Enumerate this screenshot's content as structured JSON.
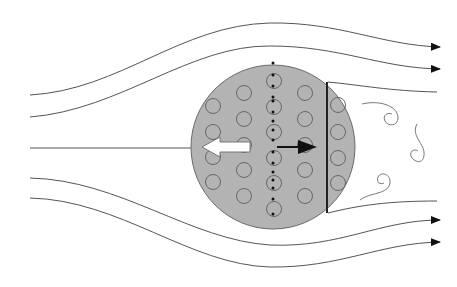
{
  "diagram": {
    "type": "flow-around-body",
    "colors": {
      "background": "#ffffff",
      "body_fill": "#b3b3b3",
      "body_stroke": "#6a6a6a",
      "streamline": "#555555",
      "arrow_dark": "#111111",
      "arrow_light": "#ffffff"
    },
    "body": {
      "cx": 273,
      "cy": 147,
      "r": 82
    },
    "divider_line": {
      "x": 327,
      "y1": 82,
      "y2": 212
    },
    "streamlines_count": 7,
    "inner_circle_columns": [
      {
        "x": 213,
        "ys": [
          106,
          132,
          157,
          182
        ]
      },
      {
        "x": 244,
        "ys": [
          93,
          119,
          145,
          170,
          196
        ]
      },
      {
        "x": 274,
        "ys": [
          81,
          107,
          132,
          158,
          183,
          209
        ]
      },
      {
        "x": 305,
        "ys": [
          93,
          119,
          145,
          170,
          196
        ]
      },
      {
        "x": 338,
        "ys": [
          105,
          132,
          158,
          183
        ]
      }
    ],
    "arrows": [
      {
        "name": "white-force-arrow",
        "direction": "left"
      },
      {
        "name": "black-velocity-arrow",
        "direction": "right"
      }
    ],
    "wake_vortices": 3
  }
}
